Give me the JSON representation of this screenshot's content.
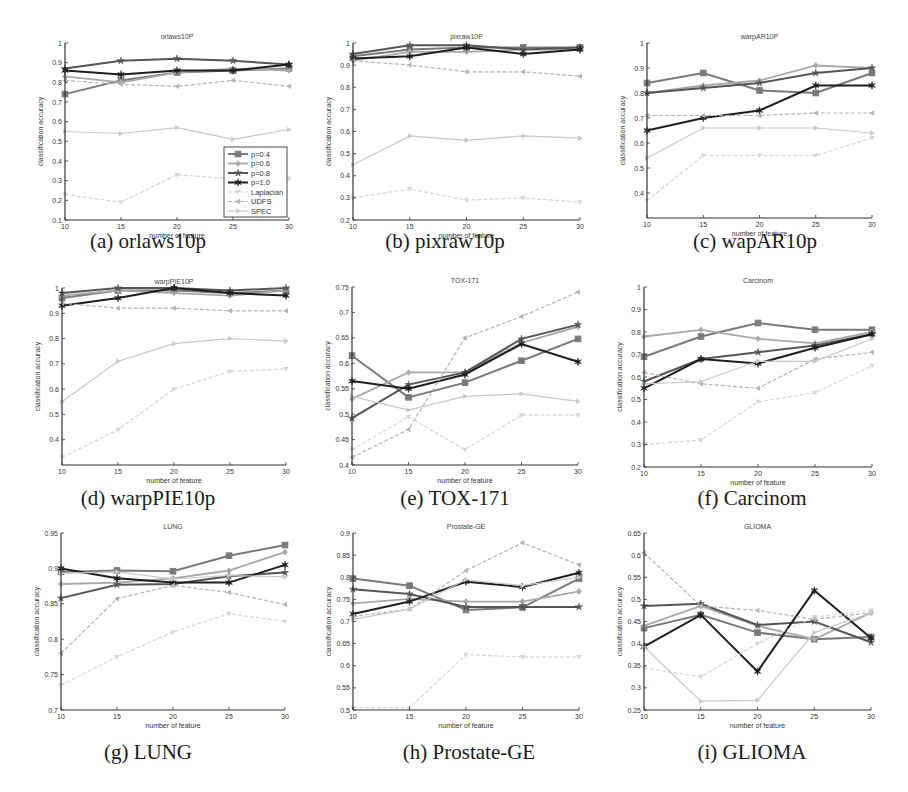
{
  "figure": {
    "legend": [
      "p=0.4",
      "p=0.6",
      "p=0.8",
      "p=1.0",
      "Laplacian",
      "UDFS",
      "SPEC"
    ],
    "series_styles": [
      {
        "name": "p=0.4",
        "color": "#7a7a7a",
        "width": 2.0,
        "marker": "square",
        "dash": ""
      },
      {
        "name": "p=0.6",
        "color": "#a8a8a8",
        "width": 1.8,
        "marker": "diamond",
        "dash": ""
      },
      {
        "name": "p=0.8",
        "color": "#555555",
        "width": 2.0,
        "marker": "star",
        "dash": ""
      },
      {
        "name": "p=1.0",
        "color": "#1e1e1e",
        "width": 2.0,
        "marker": "hexagram",
        "dash": ""
      },
      {
        "name": "Laplacian",
        "color": "#d6d6d6",
        "width": 1.2,
        "marker": "triangle-down",
        "dash": "4,2"
      },
      {
        "name": "UDFS",
        "color": "#b4b4b4",
        "width": 1.2,
        "marker": "triangle-left",
        "dash": "4,2"
      },
      {
        "name": "SPEC",
        "color": "#c8c8c8",
        "width": 1.2,
        "marker": "triangle-right",
        "dash": ""
      }
    ]
  },
  "chart_data": [
    {
      "id": "a",
      "type": "line",
      "title": "orlaws10P",
      "caption": "(a) orlaws10p",
      "xlabel": "number of feature",
      "ylabel": "classification accuracy",
      "x": [
        10,
        15,
        20,
        25,
        30
      ],
      "xticks": [
        "10",
        "15",
        "20",
        "25",
        "30"
      ],
      "ylim": [
        0.1,
        1.0
      ],
      "yticks": [
        "0.1",
        "0.2",
        "0.3",
        "0.4",
        "0.5",
        "0.6",
        "0.7",
        "0.8",
        "0.9",
        "1"
      ],
      "legend_position": "lower right",
      "grid": false,
      "series": [
        {
          "name": "p=0.4",
          "values": [
            0.74,
            0.81,
            0.85,
            0.86,
            0.87
          ]
        },
        {
          "name": "p=0.6",
          "values": [
            0.83,
            0.8,
            0.85,
            0.87,
            0.86
          ]
        },
        {
          "name": "p=0.8",
          "values": [
            0.87,
            0.91,
            0.92,
            0.91,
            0.89
          ]
        },
        {
          "name": "p=1.0",
          "values": [
            0.86,
            0.84,
            0.86,
            0.86,
            0.89
          ]
        },
        {
          "name": "Laplacian",
          "values": [
            0.23,
            0.19,
            0.33,
            0.31,
            0.31
          ]
        },
        {
          "name": "UDFS",
          "values": [
            0.81,
            0.79,
            0.78,
            0.81,
            0.78
          ]
        },
        {
          "name": "SPEC",
          "values": [
            0.55,
            0.54,
            0.57,
            0.51,
            0.56
          ]
        }
      ]
    },
    {
      "id": "b",
      "type": "line",
      "title": "pixraw10P",
      "caption": "(b)  pixraw10p",
      "xlabel": "number of feature",
      "ylabel": "classification accuracy",
      "x": [
        10,
        15,
        20,
        25,
        30
      ],
      "xticks": [
        "10",
        "15",
        "20",
        "25",
        "30"
      ],
      "ylim": [
        0.2,
        1.0
      ],
      "yticks": [
        "0.2",
        "0.3",
        "0.4",
        "0.5",
        "0.6",
        "0.7",
        "0.8",
        "0.9",
        "1"
      ],
      "grid": false,
      "series": [
        {
          "name": "p=0.4",
          "values": [
            0.94,
            0.97,
            0.98,
            0.98,
            0.98
          ]
        },
        {
          "name": "p=0.6",
          "values": [
            0.92,
            0.96,
            0.96,
            0.97,
            0.97
          ]
        },
        {
          "name": "p=0.8",
          "values": [
            0.95,
            0.99,
            0.99,
            0.97,
            0.98
          ]
        },
        {
          "name": "p=1.0",
          "values": [
            0.93,
            0.94,
            0.98,
            0.95,
            0.97
          ]
        },
        {
          "name": "Laplacian",
          "values": [
            0.3,
            0.34,
            0.29,
            0.3,
            0.28
          ]
        },
        {
          "name": "UDFS",
          "values": [
            0.92,
            0.9,
            0.87,
            0.87,
            0.85
          ]
        },
        {
          "name": "SPEC",
          "values": [
            0.45,
            0.58,
            0.56,
            0.58,
            0.57
          ]
        }
      ]
    },
    {
      "id": "c",
      "type": "line",
      "title": "warpAR10P",
      "caption": "(c)  wapAR10p",
      "xlabel": "number of feature",
      "ylabel": "classification accuracy",
      "x": [
        10,
        15,
        20,
        25,
        30
      ],
      "xticks": [
        "10",
        "15",
        "20",
        "25",
        "30"
      ],
      "ylim": [
        0.3,
        1.0
      ],
      "yticks": [
        "0.4",
        "0.5",
        "0.6",
        "0.7",
        "0.8",
        "0.9",
        "1"
      ],
      "grid": false,
      "series": [
        {
          "name": "p=0.4",
          "values": [
            0.84,
            0.88,
            0.81,
            0.8,
            0.88
          ]
        },
        {
          "name": "p=0.6",
          "values": [
            0.8,
            0.83,
            0.85,
            0.91,
            0.9
          ]
        },
        {
          "name": "p=0.8",
          "values": [
            0.8,
            0.82,
            0.84,
            0.88,
            0.9
          ]
        },
        {
          "name": "p=1.0",
          "values": [
            0.65,
            0.7,
            0.73,
            0.83,
            0.83
          ]
        },
        {
          "name": "Laplacian",
          "values": [
            0.37,
            0.55,
            0.55,
            0.55,
            0.62
          ]
        },
        {
          "name": "UDFS",
          "values": [
            0.71,
            0.71,
            0.71,
            0.72,
            0.72
          ]
        },
        {
          "name": "SPEC",
          "values": [
            0.54,
            0.66,
            0.66,
            0.66,
            0.64
          ]
        }
      ]
    },
    {
      "id": "d",
      "type": "line",
      "title": "warpPIE10P",
      "caption": "(d)  warpPIE10p",
      "xlabel": "number of feature",
      "ylabel": "classification accuracy",
      "x": [
        10,
        15,
        20,
        25,
        30
      ],
      "xticks": [
        "10",
        "15",
        "20",
        "25",
        "30"
      ],
      "ylim": [
        0.3,
        1.0
      ],
      "yticks": [
        "0.4",
        "0.5",
        "0.6",
        "0.7",
        "0.8",
        "0.9",
        "1"
      ],
      "grid": false,
      "series": [
        {
          "name": "p=0.4",
          "values": [
            0.96,
            0.99,
            0.99,
            0.98,
            0.99
          ]
        },
        {
          "name": "p=0.6",
          "values": [
            0.97,
            0.99,
            0.98,
            0.97,
            0.99
          ]
        },
        {
          "name": "p=0.8",
          "values": [
            0.98,
            1.0,
            1.0,
            0.99,
            1.0
          ]
        },
        {
          "name": "p=1.0",
          "values": [
            0.93,
            0.96,
            1.0,
            0.98,
            0.97
          ]
        },
        {
          "name": "Laplacian",
          "values": [
            0.33,
            0.44,
            0.6,
            0.67,
            0.68
          ]
        },
        {
          "name": "UDFS",
          "values": [
            0.94,
            0.92,
            0.92,
            0.91,
            0.91
          ]
        },
        {
          "name": "SPEC",
          "values": [
            0.55,
            0.71,
            0.78,
            0.8,
            0.79
          ]
        }
      ]
    },
    {
      "id": "e",
      "type": "line",
      "title": "TOX-171",
      "caption": "(e)  TOX-171",
      "xlabel": "number of feature",
      "ylabel": "classification accuracy",
      "x": [
        10,
        15,
        20,
        25,
        30
      ],
      "xticks": [
        "10",
        "15",
        "20",
        "25",
        "30"
      ],
      "ylim": [
        0.4,
        0.75
      ],
      "yticks": [
        "0.4",
        "0.45",
        "0.5",
        "0.55",
        "0.6",
        "0.65",
        "0.7",
        "0.75"
      ],
      "grid": false,
      "series": [
        {
          "name": "p=0.4",
          "values": [
            0.615,
            0.533,
            0.562,
            0.605,
            0.648
          ]
        },
        {
          "name": "p=0.6",
          "values": [
            0.53,
            0.582,
            0.582,
            0.64,
            0.672
          ]
        },
        {
          "name": "p=0.8",
          "values": [
            0.492,
            0.558,
            0.582,
            0.648,
            0.676
          ]
        },
        {
          "name": "p=1.0",
          "values": [
            0.565,
            0.55,
            0.578,
            0.638,
            0.603
          ]
        },
        {
          "name": "Laplacian",
          "values": [
            0.43,
            0.495,
            0.43,
            0.498,
            0.498
          ]
        },
        {
          "name": "UDFS",
          "values": [
            0.415,
            0.47,
            0.65,
            0.692,
            0.74
          ]
        },
        {
          "name": "SPEC",
          "values": [
            0.535,
            0.508,
            0.535,
            0.54,
            0.525
          ]
        }
      ]
    },
    {
      "id": "f",
      "type": "line",
      "title": "Carcinom",
      "caption": "(f) Carcinom",
      "xlabel": "number of feature",
      "ylabel": "classification accuracy",
      "x": [
        10,
        15,
        20,
        25,
        30
      ],
      "xticks": [
        "10",
        "15",
        "20",
        "25",
        "30"
      ],
      "ylim": [
        0.2,
        1.0
      ],
      "yticks": [
        "0.2",
        "0.3",
        "0.4",
        "0.5",
        "0.6",
        "0.7",
        "0.8",
        "0.9",
        "1"
      ],
      "grid": false,
      "series": [
        {
          "name": "p=0.4",
          "values": [
            0.69,
            0.78,
            0.84,
            0.81,
            0.81
          ]
        },
        {
          "name": "p=0.6",
          "values": [
            0.78,
            0.81,
            0.77,
            0.75,
            0.8
          ]
        },
        {
          "name": "p=0.8",
          "values": [
            0.58,
            0.68,
            0.71,
            0.74,
            0.79
          ]
        },
        {
          "name": "p=1.0",
          "values": [
            0.55,
            0.68,
            0.66,
            0.73,
            0.79
          ]
        },
        {
          "name": "Laplacian",
          "values": [
            0.3,
            0.32,
            0.49,
            0.53,
            0.65
          ]
        },
        {
          "name": "UDFS",
          "values": [
            0.62,
            0.57,
            0.55,
            0.68,
            0.71
          ]
        },
        {
          "name": "SPEC",
          "values": [
            0.57,
            0.58,
            0.67,
            0.67,
            0.77
          ]
        }
      ]
    },
    {
      "id": "g",
      "type": "line",
      "title": "LUNG",
      "caption": "(g) LUNG",
      "xlabel": "number of feature",
      "ylabel": "classification accuracy",
      "x": [
        10,
        15,
        20,
        25,
        30
      ],
      "xticks": [
        "10",
        "15",
        "20",
        "25",
        "30"
      ],
      "ylim": [
        0.7,
        0.95
      ],
      "yticks": [
        "0.7",
        "0.75",
        "0.8",
        "0.85",
        "0.9",
        "0.95"
      ],
      "grid": false,
      "series": [
        {
          "name": "p=0.4",
          "values": [
            0.895,
            0.897,
            0.896,
            0.918,
            0.933
          ]
        },
        {
          "name": "p=0.6",
          "values": [
            0.878,
            0.88,
            0.886,
            0.897,
            0.923
          ]
        },
        {
          "name": "p=0.8",
          "values": [
            0.858,
            0.877,
            0.878,
            0.889,
            0.894
          ]
        },
        {
          "name": "p=1.0",
          "values": [
            0.9,
            0.886,
            0.88,
            0.88,
            0.905
          ]
        },
        {
          "name": "Laplacian",
          "values": [
            0.735,
            0.775,
            0.81,
            0.836,
            0.825
          ]
        },
        {
          "name": "UDFS",
          "values": [
            0.78,
            0.857,
            0.876,
            0.866,
            0.849
          ]
        },
        {
          "name": "SPEC",
          "values": [
            0.893,
            0.895,
            0.885,
            0.89,
            0.888
          ]
        }
      ]
    },
    {
      "id": "h",
      "type": "line",
      "title": "Prostate-GE",
      "caption": "(h) Prostate-GE",
      "xlabel": "number of feature",
      "ylabel": "classification accuracy",
      "x": [
        10,
        15,
        20,
        25,
        30
      ],
      "xticks": [
        "10",
        "15",
        "20",
        "25",
        "30"
      ],
      "ylim": [
        0.5,
        0.9
      ],
      "yticks": [
        "0.5",
        "0.55",
        "0.6",
        "0.65",
        "0.7",
        "0.75",
        "0.8",
        "0.85",
        "0.9"
      ],
      "grid": false,
      "series": [
        {
          "name": "p=0.4",
          "values": [
            0.797,
            0.781,
            0.726,
            0.732,
            0.797
          ]
        },
        {
          "name": "p=0.6",
          "values": [
            0.741,
            0.751,
            0.745,
            0.745,
            0.768
          ]
        },
        {
          "name": "p=0.8",
          "values": [
            0.773,
            0.762,
            0.733,
            0.733,
            0.733
          ]
        },
        {
          "name": "p=1.0",
          "values": [
            0.717,
            0.745,
            0.79,
            0.778,
            0.81
          ]
        },
        {
          "name": "Laplacian",
          "values": [
            0.505,
            0.505,
            0.625,
            0.62,
            0.62
          ]
        },
        {
          "name": "UDFS",
          "values": [
            0.711,
            0.728,
            0.815,
            0.878,
            0.828
          ]
        },
        {
          "name": "SPEC",
          "values": [
            0.705,
            0.728,
            0.795,
            0.781,
            0.8
          ]
        }
      ]
    },
    {
      "id": "i",
      "type": "line",
      "title": "GLIOMA",
      "caption": "(i) GLIOMA",
      "xlabel": "number of feature",
      "ylabel": "classification accuracy",
      "x": [
        10,
        15,
        20,
        25,
        30
      ],
      "xticks": [
        "10",
        "15",
        "20",
        "25",
        "30"
      ],
      "ylim": [
        0.25,
        0.65
      ],
      "yticks": [
        "0.25",
        "0.3",
        "0.35",
        "0.4",
        "0.45",
        "0.5",
        "0.55",
        "0.6",
        "0.65"
      ],
      "grid": false,
      "series": [
        {
          "name": "p=0.4",
          "values": [
            0.435,
            0.465,
            0.425,
            0.41,
            0.415
          ]
        },
        {
          "name": "p=0.6",
          "values": [
            0.44,
            0.485,
            0.44,
            0.41,
            0.47
          ]
        },
        {
          "name": "p=0.8",
          "values": [
            0.485,
            0.49,
            0.442,
            0.45,
            0.403
          ]
        },
        {
          "name": "p=1.0",
          "values": [
            0.393,
            0.465,
            0.337,
            0.52,
            0.413
          ]
        },
        {
          "name": "Laplacian",
          "values": [
            0.345,
            0.325,
            0.4,
            0.46,
            0.475
          ]
        },
        {
          "name": "UDFS",
          "values": [
            0.605,
            0.485,
            0.475,
            0.455,
            0.47
          ]
        },
        {
          "name": "SPEC",
          "values": [
            0.393,
            0.27,
            0.272,
            0.425,
            0.47
          ]
        }
      ]
    }
  ],
  "layout": {
    "panels": [
      {
        "left": 65,
        "top": 43,
        "width": 224,
        "height": 177,
        "cap_x": 148,
        "cap_y": 229
      },
      {
        "left": 353,
        "top": 43,
        "width": 227,
        "height": 177,
        "cap_x": 445,
        "cap_y": 229
      },
      {
        "left": 647,
        "top": 43,
        "width": 225,
        "height": 175,
        "cap_x": 755,
        "cap_y": 229
      },
      {
        "left": 62,
        "top": 288,
        "width": 224,
        "height": 177,
        "cap_x": 148,
        "cap_y": 486
      },
      {
        "left": 352,
        "top": 287,
        "width": 226,
        "height": 178,
        "cap_x": 455,
        "cap_y": 486
      },
      {
        "left": 644,
        "top": 287,
        "width": 228,
        "height": 180,
        "cap_x": 752,
        "cap_y": 486
      },
      {
        "left": 61,
        "top": 533,
        "width": 224,
        "height": 177,
        "cap_x": 148,
        "cap_y": 740
      },
      {
        "left": 353,
        "top": 533,
        "width": 226,
        "height": 177,
        "cap_x": 469,
        "cap_y": 740
      },
      {
        "left": 644,
        "top": 533,
        "width": 227,
        "height": 177,
        "cap_x": 752,
        "cap_y": 740
      }
    ]
  }
}
